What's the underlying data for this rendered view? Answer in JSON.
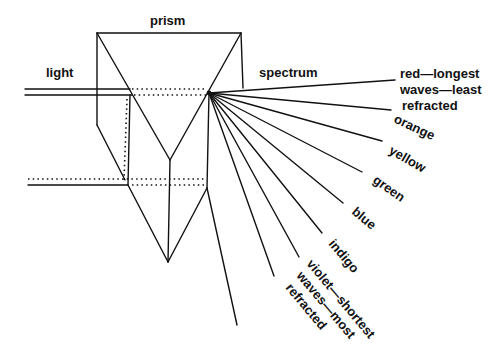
{
  "diagram": {
    "title": "prism",
    "labels": {
      "prism": "prism",
      "light": "light",
      "spectrum": "spectrum"
    },
    "spectrum_colors": [
      {
        "name": "red",
        "lines": [
          "red—longest",
          "waves—least",
          "refracted"
        ]
      },
      {
        "name": "orange",
        "lines": [
          "orange"
        ]
      },
      {
        "name": "yellow",
        "lines": [
          "yellow"
        ]
      },
      {
        "name": "green",
        "lines": [
          "green"
        ]
      },
      {
        "name": "blue",
        "lines": [
          "blue"
        ]
      },
      {
        "name": "indigo",
        "lines": [
          "indigo"
        ]
      },
      {
        "name": "violet",
        "lines": [
          "violet—shortest",
          "waves—most",
          "refracted"
        ]
      }
    ],
    "colors": {
      "ink": "#111111",
      "background": "#ffffff"
    }
  }
}
